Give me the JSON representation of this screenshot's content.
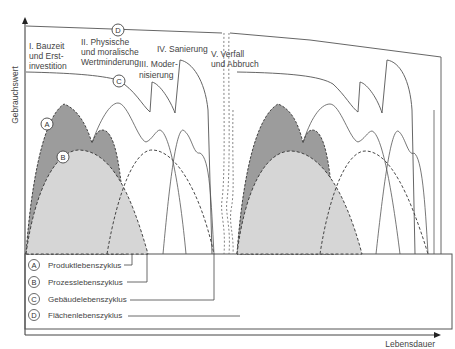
{
  "diagram": {
    "y_axis_label": "Gebrauchswert",
    "x_axis_label": "Lebensdauer",
    "phases": [
      {
        "id": "I",
        "lines": [
          "I. Bauzeit",
          "und Erst-",
          "investition"
        ]
      },
      {
        "id": "II",
        "lines": [
          "II. Physische",
          "und moralische",
          "Wertminderung"
        ]
      },
      {
        "id": "III",
        "lines": [
          "III. Moder-",
          "nisierung"
        ]
      },
      {
        "id": "IV",
        "lines": [
          "IV. Sanierung"
        ]
      },
      {
        "id": "V",
        "lines": [
          "V. Verfall",
          "und Abbruch"
        ]
      }
    ],
    "markers": {
      "A": "A",
      "B": "B",
      "C": "C",
      "D": "D"
    },
    "legend": [
      {
        "key": "A",
        "label": "Produktlebenszyklus"
      },
      {
        "key": "B",
        "label": "Prozesslebenszyklus"
      },
      {
        "key": "C",
        "label": "Gebäudelebenszyklus"
      },
      {
        "key": "D",
        "label": "Flächenlebenszyklus"
      }
    ],
    "colors": {
      "product_fill": "#9a9a9a",
      "process_fill": "#d6d6d6",
      "line": "#555555"
    }
  }
}
